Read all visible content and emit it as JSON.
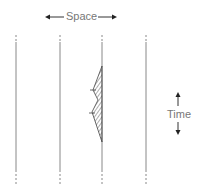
{
  "labels": {
    "space": "Space",
    "time": "Time"
  },
  "traces": {
    "count": 4,
    "x_positions": [
      16,
      60,
      102,
      146
    ]
  },
  "wave": {
    "trace_index": 2,
    "description": "hatched pulse on third trace"
  },
  "colors": {
    "line": "#888888",
    "text": "#777777",
    "arrow": "#222222"
  }
}
